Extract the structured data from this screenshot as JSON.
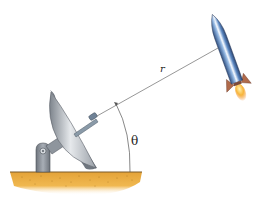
{
  "diagram": {
    "labels": {
      "distance": "r",
      "angle": "θ"
    },
    "elements": [
      {
        "name": "ground",
        "description": "sandy ground strip"
      },
      {
        "name": "antenna-mount",
        "description": "grey pedestal with pivot"
      },
      {
        "name": "satellite-dish",
        "description": "parabolic dish antenna with feed horn"
      },
      {
        "name": "line-of-sight",
        "description": "line from antenna to rocket, length r"
      },
      {
        "name": "angle-arc",
        "description": "arc from horizontal ground to line of sight, angle θ"
      },
      {
        "name": "rocket",
        "description": "blue rocket with flame, flying upward"
      }
    ],
    "colors": {
      "ground": "#e8a83a",
      "ground_dark": "#c98a2a",
      "mount": "#8a9098",
      "dish": "#c8ccd2",
      "rocket_body": "#5a86c0",
      "rocket_fins": "#b06a4a",
      "flame": "#f5a623",
      "line": "#6a6a6a"
    }
  }
}
